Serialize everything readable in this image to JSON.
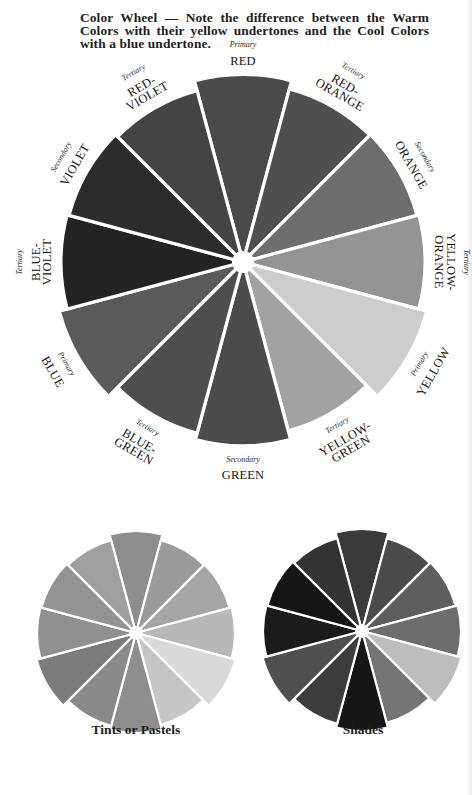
{
  "caption": "Color Wheel — Note the difference between the Warm Colors with their yellow undertones and the Cool Colors with a blue undertone.",
  "main_wheel": {
    "segments": [
      {
        "category": "Primary",
        "name": [
          "RED"
        ],
        "gray": "#4a4a4a",
        "reach": 1.03
      },
      {
        "category": "Tertiary",
        "name": [
          "RED-",
          "ORANGE"
        ],
        "gray": "#4f4f4f",
        "reach": 0.985
      },
      {
        "category": "Secondary",
        "name": [
          "ORANGE"
        ],
        "gray": "#6e6e6e",
        "reach": 0.99
      },
      {
        "category": "Tertiary",
        "name": [
          "YELLOW-",
          "ORANGE"
        ],
        "gray": "#949494",
        "reach": 1.0
      },
      {
        "category": "Primary",
        "name": [
          "YELLOW"
        ],
        "gray": "#cdcdcd",
        "reach": 1.045
      },
      {
        "category": "Tertiary",
        "name": [
          "YELLOW-",
          "GREEN"
        ],
        "gray": "#a2a2a2",
        "reach": 0.96
      },
      {
        "category": "Secondary",
        "name": [
          "GREEN"
        ],
        "gray": "#4b4b4b",
        "reach": 1.01
      },
      {
        "category": "Tertiary",
        "name": [
          "BLUE-",
          "GREEN"
        ],
        "gray": "#4e4e4e",
        "reach": 0.975
      },
      {
        "category": "Primary",
        "name": [
          "BLUE"
        ],
        "gray": "#5a5a5a",
        "reach": 1.045
      },
      {
        "category": "Tertiary",
        "name": [
          "BLUE-",
          "VIOLET"
        ],
        "gray": "#232323",
        "reach": 1.0
      },
      {
        "category": "Secondary",
        "name": [
          "VIOLET"
        ],
        "gray": "#2c2c2c",
        "reach": 0.99
      },
      {
        "category": "Tertiary",
        "name": [
          "RED-",
          "VIOLET"
        ],
        "gray": "#444444",
        "reach": 0.975
      }
    ]
  },
  "tints_wheel": {
    "caption": "Tints or Pastels",
    "grays": [
      "#8d8d8d",
      "#9a9a9a",
      "#a5a5a5",
      "#b8b8b8",
      "#d9d9d9",
      "#c6c6c6",
      "#8e8e8e",
      "#8a8a8a",
      "#7c7c7c",
      "#909090",
      "#939393",
      "#9f9f9f"
    ],
    "reach": [
      1.03,
      0.97,
      0.98,
      1.0,
      1.04,
      0.96,
      1.01,
      0.97,
      1.04,
      1.0,
      0.99,
      0.97
    ]
  },
  "shades_wheel": {
    "caption": "Shades",
    "grays": [
      "#3a3a3a",
      "#4b4b4b",
      "#5e5e5e",
      "#6d6d6d",
      "#bdbdbd",
      "#747474",
      "#161616",
      "#3c3c3c",
      "#505050",
      "#1b1b1b",
      "#141414",
      "#333333"
    ],
    "reach": [
      1.03,
      0.97,
      0.98,
      1.0,
      1.04,
      0.96,
      1.01,
      0.97,
      1.04,
      1.0,
      0.99,
      0.97
    ]
  }
}
